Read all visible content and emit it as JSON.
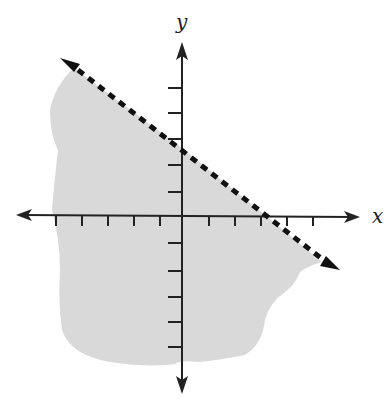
{
  "graph": {
    "x_label": "x",
    "y_label": "y",
    "origin_px": [
      182,
      215
    ],
    "unit_px": 26,
    "x_ticks": [
      -5,
      -4,
      -3,
      -2,
      -1,
      1,
      2,
      3,
      4,
      5
    ],
    "y_ticks": [
      -5,
      -4,
      -3,
      -2,
      -1,
      1,
      2,
      3,
      4,
      5
    ],
    "boundary_line": {
      "style": "dashed",
      "y_intercept": 2.5,
      "x_intercept": 3.2,
      "slope": -0.78
    },
    "shaded_region": "below boundary line",
    "colors": {
      "axis": "#222222",
      "shade": "#d9d9d9",
      "line": "#111111"
    }
  }
}
